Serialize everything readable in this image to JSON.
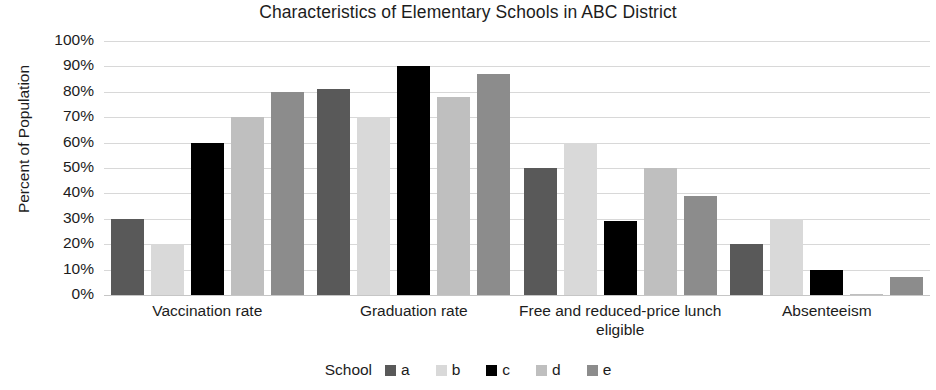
{
  "chart_data": {
    "type": "bar",
    "title": "Characteristics of Elementary Schools in ABC District",
    "xlabel": "",
    "ylabel": "Percent of Population",
    "ylim": [
      0,
      100
    ],
    "ytick_labels": [
      "100%",
      "90%",
      "80%",
      "70%",
      "60%",
      "50%",
      "40%",
      "30%",
      "20%",
      "10%",
      "0%"
    ],
    "ytick_values": [
      100,
      90,
      80,
      70,
      60,
      50,
      40,
      30,
      20,
      10,
      0
    ],
    "grid": true,
    "legend_position": "bottom",
    "legend_title": "School",
    "categories": [
      "Vaccination rate",
      "Graduation rate",
      "Free and reduced-price lunch eligible",
      "Absenteeism"
    ],
    "series": [
      {
        "name": "a",
        "color": "#595959",
        "values": [
          30,
          81,
          50,
          20
        ]
      },
      {
        "name": "b",
        "color": "#d9d9d9",
        "values": [
          20,
          70,
          60,
          30
        ]
      },
      {
        "name": "c",
        "color": "#000000",
        "values": [
          60,
          90,
          29,
          10
        ]
      },
      {
        "name": "d",
        "color": "#bfbfbf",
        "values": [
          70,
          78,
          50,
          0.5
        ]
      },
      {
        "name": "e",
        "color": "#8c8c8c",
        "values": [
          80,
          87,
          39,
          7
        ]
      }
    ]
  }
}
